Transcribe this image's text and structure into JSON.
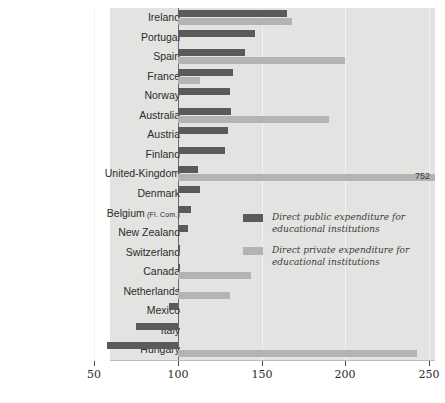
{
  "chart_data": {
    "type": "bar",
    "orientation": "horizontal",
    "title": "",
    "xlabel": "",
    "ylabel": "",
    "xlim": [
      50,
      250
    ],
    "xticks": [
      50,
      100,
      150,
      200,
      250
    ],
    "xtick_labels": [
      "50",
      "100",
      "150",
      "200",
      "250"
    ],
    "grid": true,
    "baseline": 100,
    "legend_position": "inside-right-middle",
    "categories": [
      "Ireland",
      "Portugal",
      "Spain",
      "France",
      "Norway",
      "Australia",
      "Austria",
      "Finland",
      "United-Kingdom",
      "Denmark",
      "Belgium (Fl. Com.)",
      "New Zealand",
      "Switzerland",
      "Canada",
      "Netherlands",
      "Mexico",
      "Italy",
      "Hungary"
    ],
    "series": [
      {
        "name": "Direct public expenditure for educational institutions",
        "color": "#5a5a5a",
        "values": [
          165,
          146,
          140,
          133,
          131,
          132,
          130,
          128,
          112,
          113,
          108,
          106,
          101,
          101,
          100,
          95,
          75,
          58
        ]
      },
      {
        "name": "Direct private expenditure for educational institutions",
        "color": "#b3b3b1",
        "values": [
          168,
          100,
          200,
          113,
          100,
          190,
          100,
          100,
          752,
          100,
          100,
          100,
          100,
          144,
          131,
          100,
          100,
          243
        ]
      }
    ],
    "annotations": [
      {
        "category": "United-Kingdom",
        "series": "Direct private expenditure for educational institutions",
        "label": "752",
        "clipped": true
      }
    ]
  },
  "row_labels": [
    {
      "name": "Ireland",
      "sub": ""
    },
    {
      "name": "Portugal",
      "sub": ""
    },
    {
      "name": "Spain",
      "sub": ""
    },
    {
      "name": "France",
      "sub": ""
    },
    {
      "name": "Norway",
      "sub": ""
    },
    {
      "name": "Australia",
      "sub": ""
    },
    {
      "name": "Austria",
      "sub": ""
    },
    {
      "name": "Finland",
      "sub": ""
    },
    {
      "name": "United-Kingdom",
      "sub": ""
    },
    {
      "name": "Denmark",
      "sub": ""
    },
    {
      "name": "Belgium",
      "sub": "(Fl. Com.)"
    },
    {
      "name": "New Zealand",
      "sub": ""
    },
    {
      "name": "Switzerland",
      "sub": ""
    },
    {
      "name": "Canada",
      "sub": ""
    },
    {
      "name": "Netherlands",
      "sub": ""
    },
    {
      "name": "Mexico",
      "sub": ""
    },
    {
      "name": "Italy",
      "sub": ""
    },
    {
      "name": "Hungary",
      "sub": ""
    }
  ],
  "legend": {
    "items": [
      {
        "swatch_color": "#5a5a5a",
        "line1": "Direct public expenditure for",
        "line2": "educational institutions"
      },
      {
        "swatch_color": "#b3b3b1",
        "line1": "Direct private expenditure for",
        "line2": "educational institutions"
      }
    ]
  },
  "axis": {
    "ticks": [
      "50",
      "100",
      "150",
      "200",
      "250"
    ]
  },
  "colors": {
    "plot_background": "#e3e3e1",
    "public_bar": "#5a5a5a",
    "private_bar": "#b3b3b1",
    "baseline": "#6b6b6b",
    "gridline": "#f2f2f0",
    "text": "#2b2b2b"
  }
}
